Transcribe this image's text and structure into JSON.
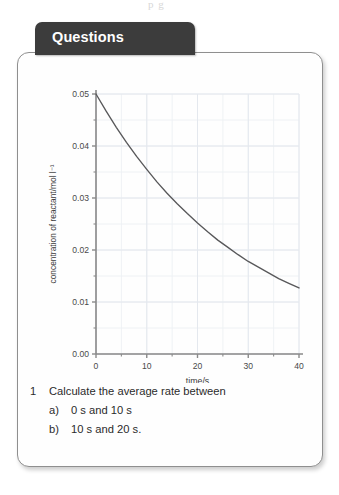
{
  "artifact_text": "p  g",
  "tab": {
    "label": "Questions"
  },
  "chart_data": {
    "type": "line",
    "title": "",
    "xlabel": "time/s",
    "ylabel": "concentration of reactant/mol l⁻¹",
    "xlim": [
      0,
      40
    ],
    "ylim": [
      0.0,
      0.05
    ],
    "x_ticks": [
      0,
      10,
      20,
      30,
      40
    ],
    "x_tick_labels": [
      "0",
      "10",
      "20",
      "30",
      "40"
    ],
    "x_minor_step": 5,
    "y_ticks": [
      0.0,
      0.01,
      0.02,
      0.03,
      0.04,
      0.05
    ],
    "y_tick_labels": [
      "0.00",
      "0.01",
      "0.02",
      "0.03",
      "0.04",
      "0.05"
    ],
    "y_minor_step": 0.005,
    "grid": true,
    "legend": "none",
    "line_color": "#58585a",
    "grid_color": "#edf0f4",
    "axis_color": "#8a8a8a",
    "series": [
      {
        "name": "reactant concentration",
        "x": [
          0,
          2,
          4,
          6,
          8,
          10,
          12,
          14,
          16,
          18,
          20,
          22,
          24,
          26,
          28,
          30,
          32,
          34,
          36,
          38,
          40
        ],
        "values": [
          0.05,
          0.0467,
          0.0436,
          0.0407,
          0.038,
          0.0355,
          0.0331,
          0.0309,
          0.0289,
          0.027,
          0.0252,
          0.0235,
          0.0219,
          0.0205,
          0.0191,
          0.0178,
          0.0167,
          0.0156,
          0.0145,
          0.0136,
          0.0127
        ]
      }
    ]
  },
  "questions": [
    {
      "number": "1",
      "text": "Calculate the average rate between"
    },
    {
      "marker": "a)",
      "text": "0 s and 10 s"
    },
    {
      "marker": "b)",
      "text": "10 s and 20 s."
    }
  ]
}
